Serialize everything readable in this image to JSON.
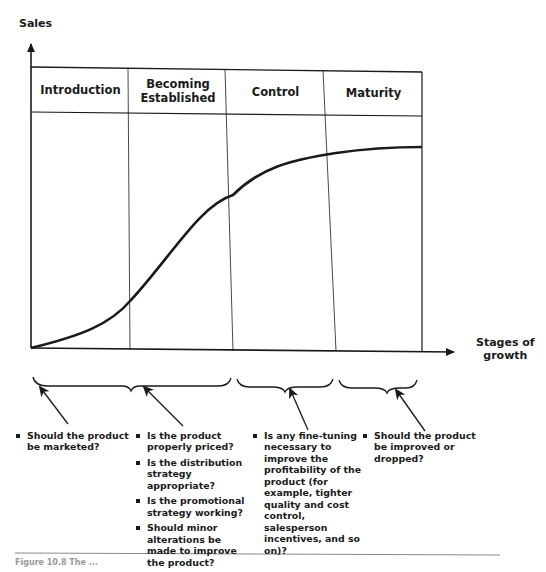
{
  "axes": {
    "y_label": "Sales",
    "x_label_line1": "Stages of",
    "x_label_line2": "growth"
  },
  "stages": [
    {
      "label": "Introduction"
    },
    {
      "label": "Becoming Established"
    },
    {
      "label": "Control"
    },
    {
      "label": "Maturity"
    }
  ],
  "questions": [
    {
      "stage": "Introduction",
      "items": [
        "Should the product be marketed?"
      ]
    },
    {
      "stage": "Becoming Established",
      "items": [
        "Is the product properly priced?",
        "Is the distribution strategy appropriate?",
        "Is the promotional strategy working?",
        "Should minor alterations be made to improve the product?"
      ]
    },
    {
      "stage": "Control",
      "items": [
        "Is any fine-tuning necessary to improve the profitability of the product (for example, tighter quality and cost control, salesperson incentives, and so on)?"
      ]
    },
    {
      "stage": "Maturity",
      "items": [
        "Should the product be improved or dropped?"
      ]
    }
  ],
  "caption": "Figure 10.8  The ...",
  "colors": {
    "ink": "#1a1a1a",
    "rule": "#888888"
  }
}
